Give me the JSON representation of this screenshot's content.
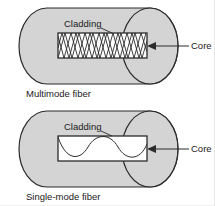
{
  "figure": {
    "background_color": "#ffffff",
    "cladding_fill": "#d4d4d4",
    "core_fill": "#ffffff",
    "outline_color": "#2b2b2b",
    "text_color": "#1a1a1a"
  },
  "panels": [
    {
      "id": "multimode",
      "caption": "Multimode fiber",
      "cladding_label": "Cladding",
      "core_label": "Core",
      "ray_type": "zigzag",
      "ray_description": "Multiple light rays reflecting at steep angles along the core"
    },
    {
      "id": "singlemode",
      "caption": "Single-mode fiber",
      "cladding_label": "Cladding",
      "core_label": "Core",
      "ray_type": "sine",
      "ray_description": "Single light ray travelling in a smooth low-amplitude wave along the core"
    }
  ]
}
